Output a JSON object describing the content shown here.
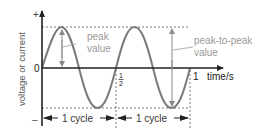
{
  "diagram": {
    "y_axis": {
      "label": "voltage or current",
      "plus": "+",
      "zero": "0",
      "minus": "–"
    },
    "x_axis": {
      "label": "time/s",
      "tick_half_num": "1",
      "tick_half_den": "2",
      "tick_one": "1"
    },
    "annotations": {
      "peak_line1": "peak",
      "peak_line2": "value",
      "p2p_line1": "peak-to-peak",
      "p2p_line2": "value"
    },
    "cycles": [
      {
        "label": "1 cycle"
      },
      {
        "label": "1 cycle"
      }
    ],
    "colors": {
      "axis": "#222222",
      "wave": "#7a7a7a",
      "annotation_text": "#9a9a9a",
      "dashed": "#555555"
    }
  }
}
